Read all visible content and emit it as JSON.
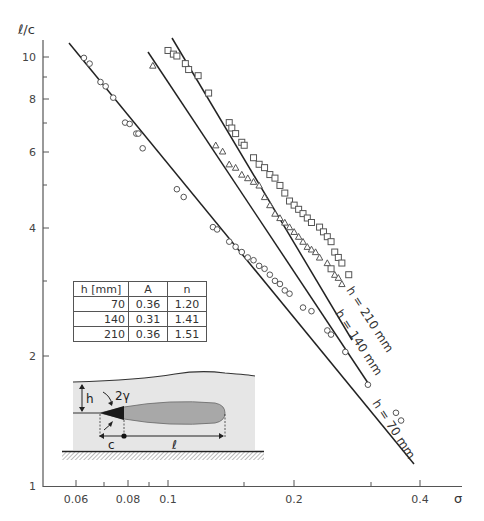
{
  "chart_data": {
    "type": "scatter",
    "title": "",
    "xlabel": "σ",
    "ylabel": "ℓ/c",
    "xscale": "log",
    "yscale": "log",
    "xlim": [
      0.052,
      0.46
    ],
    "ylim": [
      1,
      11.5
    ],
    "grid": false,
    "x_ticks": [
      0.06,
      0.08,
      0.1,
      0.2,
      0.4
    ],
    "x_tick_labels": [
      "0.06",
      "0.08",
      "0.1",
      "0.2",
      "0.4"
    ],
    "x_minor_ticks": [
      0.07,
      0.09,
      0.15,
      0.3
    ],
    "y_ticks": [
      1,
      2,
      4,
      6,
      8,
      10
    ],
    "y_tick_labels": [
      "1",
      "2",
      "4",
      "6",
      "8",
      "10"
    ],
    "y_minor_ticks": [
      3,
      5,
      7,
      9
    ],
    "series": [
      {
        "name": "h = 70 mm",
        "marker": "circle",
        "fit_line": {
          "A": 0.36,
          "n": 1.2,
          "x_range": [
            0.058,
            0.4
          ]
        },
        "points": [
          [
            0.063,
            9.9
          ],
          [
            0.065,
            9.6
          ],
          [
            0.069,
            8.7
          ],
          [
            0.071,
            8.5
          ],
          [
            0.074,
            8.0
          ],
          [
            0.079,
            7.0
          ],
          [
            0.081,
            6.95
          ],
          [
            0.084,
            6.6
          ],
          [
            0.085,
            6.6
          ],
          [
            0.087,
            6.1
          ],
          [
            0.105,
            4.9
          ],
          [
            0.109,
            4.7
          ],
          [
            0.128,
            4.0
          ],
          [
            0.131,
            3.95
          ],
          [
            0.14,
            3.7
          ],
          [
            0.145,
            3.6
          ],
          [
            0.15,
            3.5
          ],
          [
            0.155,
            3.4
          ],
          [
            0.16,
            3.35
          ],
          [
            0.165,
            3.25
          ],
          [
            0.17,
            3.2
          ],
          [
            0.175,
            3.1
          ],
          [
            0.18,
            3.0
          ],
          [
            0.185,
            2.95
          ],
          [
            0.19,
            2.85
          ],
          [
            0.195,
            2.8
          ],
          [
            0.21,
            2.6
          ],
          [
            0.22,
            2.55
          ],
          [
            0.24,
            2.3
          ],
          [
            0.245,
            2.25
          ],
          [
            0.265,
            2.05
          ],
          [
            0.3,
            1.72
          ],
          [
            0.35,
            1.48
          ],
          [
            0.36,
            1.42
          ]
        ]
      },
      {
        "name": "h = 140 mm",
        "marker": "triangle",
        "fit_line": {
          "A": 0.31,
          "n": 1.41,
          "x_range": [
            0.09,
            0.3
          ]
        },
        "points": [
          [
            0.092,
            9.5
          ],
          [
            0.13,
            6.2
          ],
          [
            0.135,
            6.0
          ],
          [
            0.14,
            5.6
          ],
          [
            0.145,
            5.5
          ],
          [
            0.15,
            5.3
          ],
          [
            0.155,
            5.2
          ],
          [
            0.16,
            5.1
          ],
          [
            0.165,
            5.0
          ],
          [
            0.17,
            4.7
          ],
          [
            0.175,
            4.5
          ],
          [
            0.18,
            4.3
          ],
          [
            0.185,
            4.2
          ],
          [
            0.19,
            4.1
          ],
          [
            0.195,
            4.0
          ],
          [
            0.2,
            3.9
          ],
          [
            0.205,
            3.8
          ],
          [
            0.21,
            3.7
          ],
          [
            0.215,
            3.6
          ],
          [
            0.22,
            3.55
          ],
          [
            0.225,
            3.5
          ],
          [
            0.23,
            3.4
          ],
          [
            0.24,
            3.3
          ],
          [
            0.25,
            3.1
          ],
          [
            0.255,
            3.05
          ],
          [
            0.26,
            2.95
          ]
        ]
      },
      {
        "name": "h = 210 mm",
        "marker": "square",
        "fit_line": {
          "A": 0.36,
          "n": 1.51,
          "x_range": [
            0.098,
            0.27
          ]
        },
        "points": [
          [
            0.1,
            10.3
          ],
          [
            0.103,
            10.1
          ],
          [
            0.105,
            10.0
          ],
          [
            0.11,
            9.6
          ],
          [
            0.112,
            9.3
          ],
          [
            0.118,
            9.0
          ],
          [
            0.125,
            8.2
          ],
          [
            0.14,
            7.0
          ],
          [
            0.142,
            6.8
          ],
          [
            0.145,
            6.6
          ],
          [
            0.15,
            6.3
          ],
          [
            0.152,
            6.2
          ],
          [
            0.16,
            5.8
          ],
          [
            0.165,
            5.6
          ],
          [
            0.17,
            5.5
          ],
          [
            0.175,
            5.3
          ],
          [
            0.18,
            5.2
          ],
          [
            0.185,
            5.0
          ],
          [
            0.19,
            4.8
          ],
          [
            0.195,
            4.6
          ],
          [
            0.2,
            4.5
          ],
          [
            0.205,
            4.4
          ],
          [
            0.21,
            4.3
          ],
          [
            0.215,
            4.2
          ],
          [
            0.22,
            4.1
          ],
          [
            0.23,
            4.0
          ],
          [
            0.235,
            3.9
          ],
          [
            0.24,
            3.8
          ],
          [
            0.245,
            3.7
          ],
          [
            0.25,
            3.5
          ],
          [
            0.255,
            3.4
          ],
          [
            0.26,
            3.3
          ],
          [
            0.27,
            3.1
          ],
          [
            0.245,
            3.2
          ]
        ]
      }
    ],
    "annotations": [
      "h = 210 mm",
      "h = 140 mm",
      "h = 70 mm"
    ],
    "table": {
      "headers": [
        "h [mm]",
        "A",
        "n"
      ],
      "rows": [
        [
          "70",
          "0.36",
          "1.20"
        ],
        [
          "140",
          "0.31",
          "1.41"
        ],
        [
          "210",
          "0.36",
          "1.51"
        ]
      ]
    },
    "inset_diagram": {
      "labels": [
        "h",
        "2γ",
        "c",
        "ℓ"
      ]
    }
  },
  "axes": {
    "y_title": "ℓ/c",
    "x_title": "σ",
    "y_ticks": [
      {
        "label": "1",
        "y": 486
      },
      {
        "label": "2",
        "y": 356
      },
      {
        "label": "4",
        "y": 228
      },
      {
        "label": "6",
        "y": 152
      },
      {
        "label": "8",
        "y": 99
      },
      {
        "label": "10",
        "y": 57
      }
    ],
    "x_ticks": [
      {
        "label": "0.06",
        "x": 76
      },
      {
        "label": "0.08",
        "x": 128
      },
      {
        "label": "0.1",
        "x": 168
      },
      {
        "label": "0.2",
        "x": 294
      },
      {
        "label": "0.4",
        "x": 420
      }
    ]
  },
  "line_labels": {
    "h210": "h = 210 mm",
    "h140": "h = 140 mm",
    "h70": "h = 70 mm"
  },
  "table": {
    "headers": [
      "h [mm]",
      "A",
      "n"
    ],
    "rows": [
      {
        "h": "70",
        "A": "0.36",
        "n": "1.20"
      },
      {
        "h": "140",
        "A": "0.31",
        "n": "1.41"
      },
      {
        "h": "210",
        "A": "0.36",
        "n": "1.51"
      }
    ]
  },
  "diagram": {
    "h_label": "h",
    "angle_label": "2γ",
    "c_label": "c",
    "l_label": "ℓ"
  },
  "colors": {
    "line": "#222222",
    "marker_stroke": "#555555",
    "diagram_fill": "#e6e6e6",
    "cavity_fill": "#a8a8a8",
    "cavity_dark": "#1a1a1a"
  }
}
